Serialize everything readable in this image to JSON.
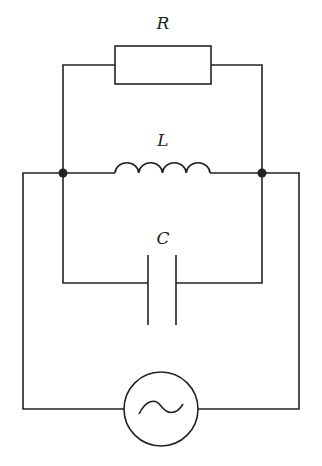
{
  "diagram": {
    "type": "circuit",
    "components": [
      {
        "id": "resistor",
        "label": "R",
        "kind": "resistor"
      },
      {
        "id": "inductor",
        "label": "L",
        "kind": "inductor"
      },
      {
        "id": "capacitor",
        "label": "C",
        "kind": "capacitor"
      },
      {
        "id": "source",
        "label": "",
        "kind": "ac-voltage-source",
        "symbol": "~"
      }
    ],
    "connections": "R, L and C are connected in parallel between two junction nodes; the AC source is connected across the nodes",
    "colors": {
      "line": "#222222",
      "background": "#ffffff"
    }
  }
}
